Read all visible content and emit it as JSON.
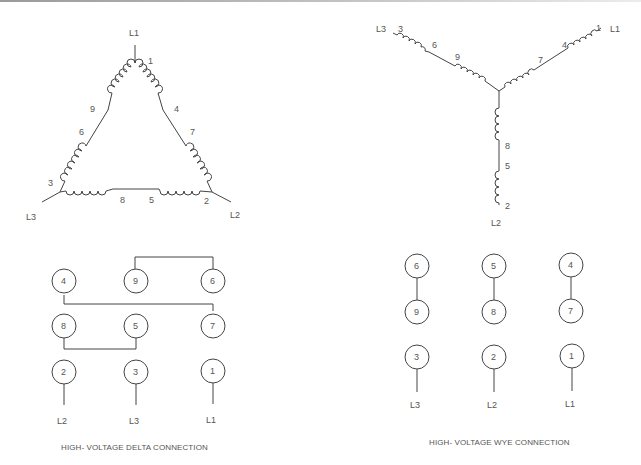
{
  "delta_diagram": {
    "lines": {
      "l1": "L1",
      "l2": "L2",
      "l3": "L3"
    },
    "winding_labels": [
      "1",
      "4",
      "7",
      "2",
      "5",
      "8",
      "3",
      "6",
      "9"
    ],
    "caption": "HIGH- VOLTAGE DELTA CONNECTION",
    "terminal_rows": [
      [
        "4",
        "9",
        "6"
      ],
      [
        "8",
        "5",
        "7"
      ],
      [
        "2",
        "3",
        "1"
      ]
    ],
    "line_labels": [
      "L2",
      "L3",
      "L1"
    ]
  },
  "wye_diagram": {
    "lines": {
      "l1": "L1",
      "l2": "L2",
      "l3": "L3"
    },
    "winding_labels": [
      "1",
      "4",
      "7",
      "2",
      "5",
      "8",
      "3",
      "6",
      "9"
    ],
    "caption": "HIGH- VOLTAGE WYE CONNECTION",
    "terminal_rows": [
      [
        "6",
        "5",
        "4"
      ],
      [
        "9",
        "8",
        "7"
      ],
      [
        "3",
        "2",
        "1"
      ]
    ],
    "line_labels": [
      "L3",
      "L2",
      "L1"
    ]
  }
}
